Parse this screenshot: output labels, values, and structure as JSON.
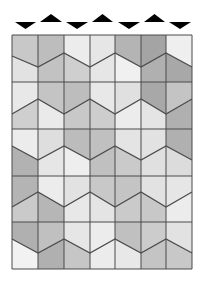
{
  "figure": {
    "width": 208,
    "height": 284,
    "background": "#ffffff",
    "line_color": "#4a4a4a",
    "marker_color": "#000000"
  },
  "grid": {
    "x_lines": [
      12,
      38,
      64,
      90,
      115,
      141,
      166,
      192
    ],
    "y_lines": [
      35,
      82,
      129,
      176,
      222,
      269
    ],
    "bands": [
      {
        "zig_y": [
          56,
          67,
          53,
          67,
          53,
          67,
          53,
          67
        ],
        "upper": [
          "#c8c8c8",
          "#bdbdbd",
          "#ececec",
          "#e6e6e6",
          "#b4b4b4",
          "#a4a4a4",
          "#efefef"
        ],
        "lower": [
          "#e2e2e2",
          "#c2c2c2",
          "#cfcfcf",
          "#e6e6e6",
          "#f0f0f0",
          "#b0b0b0",
          "#a8a8a8"
        ]
      },
      {
        "zig_y": [
          114,
          99,
          114,
          99,
          114,
          99,
          114,
          99
        ],
        "upper": [
          "#e8e8e8",
          "#c4c4c4",
          "#bdbdbd",
          "#e8e8e8",
          "#e0e0e0",
          "#a8a8a8",
          "#c4c4c4"
        ],
        "lower": [
          "#cfcfcf",
          "#eaeaea",
          "#c8c8c8",
          "#cdcdcd",
          "#ececec",
          "#e4e4e4",
          "#b0b0b0"
        ]
      },
      {
        "zig_y": [
          146,
          160,
          146,
          160,
          146,
          160,
          146,
          160
        ],
        "upper": [
          "#ececec",
          "#dedede",
          "#bcbcbc",
          "#c0c0c0",
          "#e4e4e4",
          "#e2e2e2",
          "#b0b0b0"
        ],
        "lower": [
          "#b2b2b2",
          "#e6e6e6",
          "#eeeeee",
          "#c0c0c0",
          "#cacaca",
          "#e0e0e0",
          "#dcdcdc"
        ]
      },
      {
        "zig_y": [
          207,
          192,
          207,
          192,
          207,
          192,
          207,
          192
        ],
        "upper": [
          "#b4b4b4",
          "#ececec",
          "#e2e2e2",
          "#c8c8c8",
          "#c4c4c4",
          "#e2e2e2",
          "#e6e6e6"
        ],
        "lower": [
          "#cacaca",
          "#b6b6b6",
          "#e8e8e8",
          "#e4e4e4",
          "#cacaca",
          "#c8c8c8",
          "#ececec"
        ]
      },
      {
        "zig_y": [
          239,
          253,
          239,
          253,
          239,
          253,
          239,
          253
        ],
        "upper": [
          "#b0b0b0",
          "#c0c0c0",
          "#e6e6e6",
          "#ececec",
          "#c0c0c0",
          "#cccccc",
          "#e2e2e2"
        ],
        "lower": [
          "#f2f2f2",
          "#b0b0b0",
          "#c6c6c6",
          "#ececec",
          "#e8e8e8",
          "#c4c4c4",
          "#c8c8c8"
        ]
      }
    ]
  },
  "markers": [
    {
      "direction": "down",
      "x0": 15,
      "x1": 36,
      "y_top": 22,
      "y_tip": 29
    },
    {
      "direction": "up",
      "x0": 40,
      "x1": 62,
      "y_base": 22,
      "y_tip": 14
    },
    {
      "direction": "down",
      "x0": 66,
      "x1": 88,
      "y_top": 22,
      "y_tip": 29
    },
    {
      "direction": "up",
      "x0": 92,
      "x1": 113,
      "y_base": 22,
      "y_tip": 14
    },
    {
      "direction": "down",
      "x0": 118,
      "x1": 140,
      "y_top": 22,
      "y_tip": 29
    },
    {
      "direction": "up",
      "x0": 144,
      "x1": 165,
      "y_base": 22,
      "y_tip": 14
    },
    {
      "direction": "down",
      "x0": 169,
      "x1": 191,
      "y_top": 22,
      "y_tip": 29
    }
  ]
}
